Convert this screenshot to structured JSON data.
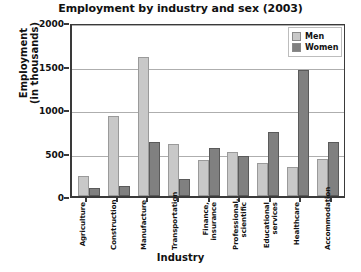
{
  "chart_data": {
    "type": "bar",
    "title": "Employment by industry and sex (2003)",
    "xlabel": "Industry",
    "ylabel": "Employment\n(in thousands)",
    "ylabel_line1": "Employment",
    "ylabel_line2": "(in thousands)",
    "ylim": [
      0,
      2000
    ],
    "yticks": [
      0,
      500,
      1000,
      1500,
      2000
    ],
    "ytick_labels": [
      "0",
      "500",
      "1000",
      "1500",
      "2000"
    ],
    "grid": true,
    "legend_position": "top-right",
    "categories": [
      "Agriculture",
      "Construction",
      "Manufacture",
      "Transportation",
      "Finance,\ninsurance",
      "Professional,\nscientific",
      "Educational\nservices",
      "Healthcare",
      "Accommodation"
    ],
    "series": [
      {
        "name": "Men",
        "color": "#c8c8c8",
        "values": [
          230,
          920,
          1600,
          600,
          410,
          510,
          375,
          330,
          420
        ]
      },
      {
        "name": "Women",
        "color": "#808080",
        "values": [
          90,
          110,
          620,
          200,
          555,
          460,
          740,
          1450,
          620
        ]
      }
    ]
  },
  "legend": {
    "items": [
      {
        "label": "Men",
        "color": "#c8c8c8"
      },
      {
        "label": "Women",
        "color": "#808080"
      }
    ]
  }
}
